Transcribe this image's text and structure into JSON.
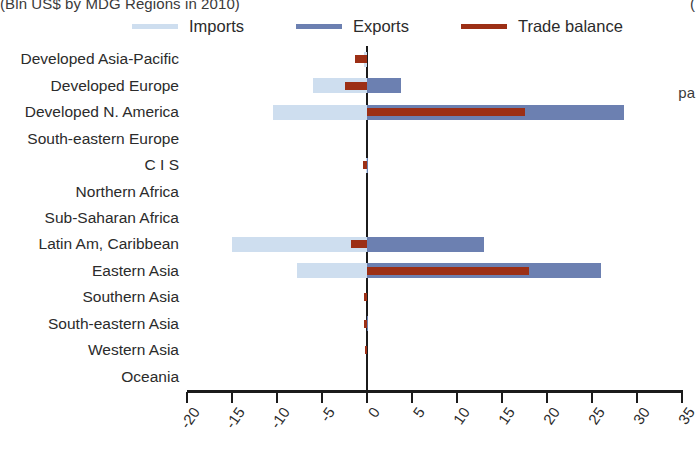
{
  "title": {
    "main": "(Bln US$ by MDG Regions in 2010)",
    "right_fragment": "(",
    "side_fragment": "pa"
  },
  "legend": {
    "position": "top",
    "items": [
      {
        "label": "Imports",
        "color": "#cedeef",
        "key": "imports"
      },
      {
        "label": "Exports",
        "color": "#6c80b1",
        "key": "exports"
      },
      {
        "label": "Trade balance",
        "color": "#9c2f15",
        "key": "balance"
      }
    ]
  },
  "chart_data": {
    "type": "bar",
    "orientation": "horizontal",
    "title": "(Bln US$ by MDG Regions in 2010)",
    "xlabel": "",
    "ylabel": "",
    "xlim": [
      -20,
      35
    ],
    "grid": false,
    "xticks": [
      -20,
      -15,
      -10,
      -5,
      0,
      5,
      10,
      15,
      20,
      25,
      30,
      35
    ],
    "xticklabels": [
      "-20",
      "-15",
      "-10",
      "-5",
      "0",
      "5",
      "10",
      "15",
      "20",
      "25",
      "30",
      "35"
    ],
    "categories": [
      "Developed Asia-Pacific",
      "Developed Europe",
      "Developed N. America",
      "South-eastern Europe",
      "C I S",
      "Northern Africa",
      "Sub-Saharan Africa",
      "Latin Am, Caribbean",
      "Eastern Asia",
      "Southern Asia",
      "South-eastern Asia",
      "Western Asia",
      "Oceania"
    ],
    "series": [
      {
        "name": "Imports",
        "color": "#cedeef",
        "values": [
          -0.3,
          -6.0,
          -10.5,
          0.0,
          -0.1,
          0.0,
          0.0,
          -15.0,
          -7.8,
          0.0,
          0.0,
          0.0,
          0.0
        ]
      },
      {
        "name": "Exports",
        "color": "#6c80b1",
        "values": [
          0.0,
          3.8,
          28.5,
          0.0,
          0.1,
          0.0,
          0.0,
          13.0,
          26.0,
          0.0,
          0.1,
          0.0,
          0.0
        ]
      },
      {
        "name": "Trade balance",
        "color": "#9c2f15",
        "values": [
          -1.3,
          -2.5,
          17.5,
          0.0,
          -0.4,
          0.0,
          0.0,
          -1.8,
          18.0,
          -0.3,
          -0.3,
          -0.2,
          0.0
        ]
      }
    ]
  }
}
